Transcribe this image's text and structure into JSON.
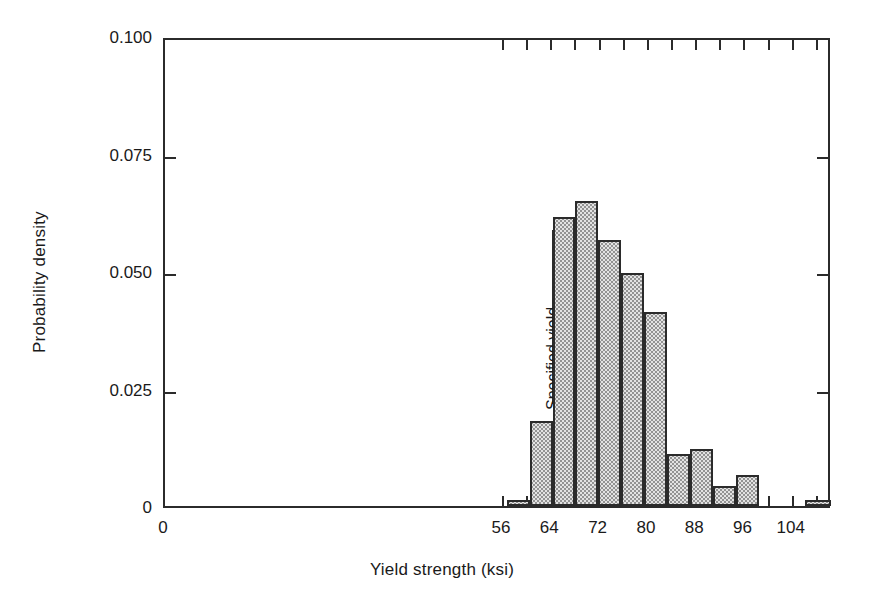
{
  "figure": {
    "background": "#ffffff",
    "frame_color": "#2b2b2b",
    "bar_fill": "#e3e3e3",
    "bar_edge": "#2b2b2b"
  },
  "chart_data": {
    "type": "bar",
    "title": "",
    "xlabel": "Yield strength (ksi)",
    "ylabel": "Probability density",
    "xlim": [
      0,
      110.5
    ],
    "ylim": [
      0,
      0.1
    ],
    "grid": false,
    "legend": null,
    "x_ticks": [
      0,
      56,
      64,
      72,
      80,
      88,
      96,
      104
    ],
    "x_tick_labels": [
      "0",
      "56",
      "64",
      "72",
      "80",
      "88",
      "96",
      "104"
    ],
    "x_minor_ticks": [
      56,
      60,
      64,
      68,
      72,
      76,
      80,
      84,
      88,
      92,
      96,
      100,
      104,
      108
    ],
    "y_ticks": [
      0,
      0.025,
      0.05,
      0.075,
      0.1
    ],
    "y_tick_labels": [
      "0",
      "0.025",
      "0.050",
      "0.075",
      "0.100"
    ],
    "bin_width": 3.8,
    "bins": [
      {
        "x0": 56.6,
        "x1": 60.4,
        "value": 0.0012
      },
      {
        "x0": 60.4,
        "x1": 64.2,
        "value": 0.018
      },
      {
        "x0": 64.2,
        "x1": 68.0,
        "value": 0.0615
      },
      {
        "x0": 68.0,
        "x1": 71.8,
        "value": 0.065
      },
      {
        "x0": 71.8,
        "x1": 75.6,
        "value": 0.0565
      },
      {
        "x0": 75.6,
        "x1": 79.4,
        "value": 0.0495
      },
      {
        "x0": 79.4,
        "x1": 83.2,
        "value": 0.0412
      },
      {
        "x0": 83.2,
        "x1": 87.0,
        "value": 0.011
      },
      {
        "x0": 87.0,
        "x1": 90.8,
        "value": 0.0122
      },
      {
        "x0": 90.8,
        "x1": 94.6,
        "value": 0.0042
      },
      {
        "x0": 94.6,
        "x1": 98.4,
        "value": 0.0067
      },
      {
        "x0": 106.0,
        "x1": 110.3,
        "value": 0.0012
      }
    ],
    "categories": [
      "56.6-60.4",
      "60.4-64.2",
      "64.2-68.0",
      "68.0-71.8",
      "71.8-75.6",
      "75.6-79.4",
      "79.4-83.2",
      "83.2-87.0",
      "87.0-90.8",
      "90.8-94.6",
      "94.6-98.4",
      "106.0-110.3"
    ],
    "values": [
      0.0012,
      0.018,
      0.0615,
      0.065,
      0.0565,
      0.0495,
      0.0412,
      0.011,
      0.0122,
      0.0042,
      0.0067,
      0.0012
    ],
    "annotations": [
      {
        "name": "specified-yield",
        "text": "Specified yield",
        "x": 64.2,
        "y_from": 0.0225,
        "y_to": 0.0595,
        "style": "vertical-line-with-rotated-label"
      }
    ]
  }
}
